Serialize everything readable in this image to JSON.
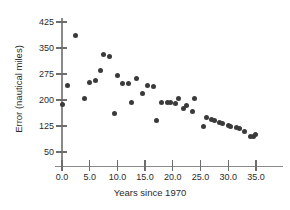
{
  "chart_data": {
    "type": "scatter",
    "title": "",
    "xlabel": "Years since 1970",
    "ylabel": "Error (nautical miles)",
    "xlim": [
      -2.5,
      40.0
    ],
    "ylim": [
      35,
      440
    ],
    "xticks": [
      0.0,
      5.0,
      10.0,
      15.0,
      20.0,
      25.0,
      30.0,
      35.0
    ],
    "xtick_labels": [
      "0.0",
      "5.0",
      "10.0",
      "15.0",
      "20.0",
      "25.0",
      "30.0",
      "35.0"
    ],
    "yticks": [
      50,
      125,
      200,
      275,
      350,
      425
    ],
    "ytick_labels": [
      "50",
      "125",
      "200",
      "275",
      "350",
      "425"
    ],
    "grid": false,
    "legend": null,
    "marker_color": "#3a3a3a",
    "axis_color": "#8a8a8a",
    "x": [
      0.0,
      1.0,
      2.5,
      4.0,
      5.0,
      6.0,
      7.0,
      7.5,
      8.5,
      9.5,
      10.0,
      11.0,
      12.0,
      12.5,
      13.5,
      14.5,
      15.5,
      16.5,
      17.0,
      18.0,
      19.0,
      19.5,
      20.5,
      21.0,
      22.0,
      22.5,
      23.5,
      24.0,
      25.5,
      26.0,
      27.0,
      27.5,
      28.5,
      29.0,
      30.0,
      30.5,
      31.5,
      32.0,
      33.0,
      34.0,
      34.5,
      35.0
    ],
    "y": [
      188,
      242,
      387,
      205,
      250,
      257,
      284,
      330,
      325,
      160,
      272,
      249,
      248,
      192,
      262,
      219,
      243,
      238,
      142,
      194,
      194,
      192,
      191,
      205,
      176,
      184,
      167,
      205,
      124,
      150,
      145,
      141,
      135,
      133,
      126,
      124,
      120,
      118,
      108,
      95,
      94,
      100
    ],
    "points": [
      {
        "x": 0.0,
        "y": 188
      },
      {
        "x": 1.0,
        "y": 242
      },
      {
        "x": 2.5,
        "y": 387
      },
      {
        "x": 4.0,
        "y": 205
      },
      {
        "x": 5.0,
        "y": 250
      },
      {
        "x": 6.0,
        "y": 257
      },
      {
        "x": 7.0,
        "y": 284
      },
      {
        "x": 7.5,
        "y": 330
      },
      {
        "x": 8.5,
        "y": 325
      },
      {
        "x": 9.5,
        "y": 160
      },
      {
        "x": 10.0,
        "y": 272
      },
      {
        "x": 11.0,
        "y": 249
      },
      {
        "x": 12.0,
        "y": 248
      },
      {
        "x": 12.5,
        "y": 192
      },
      {
        "x": 13.5,
        "y": 262
      },
      {
        "x": 14.5,
        "y": 219
      },
      {
        "x": 15.5,
        "y": 243
      },
      {
        "x": 16.5,
        "y": 238
      },
      {
        "x": 17.0,
        "y": 142
      },
      {
        "x": 18.0,
        "y": 194
      },
      {
        "x": 19.0,
        "y": 194
      },
      {
        "x": 19.5,
        "y": 192
      },
      {
        "x": 20.5,
        "y": 191
      },
      {
        "x": 21.0,
        "y": 205
      },
      {
        "x": 22.0,
        "y": 176
      },
      {
        "x": 22.5,
        "y": 184
      },
      {
        "x": 23.5,
        "y": 167
      },
      {
        "x": 24.0,
        "y": 205
      },
      {
        "x": 25.5,
        "y": 124
      },
      {
        "x": 26.0,
        "y": 150
      },
      {
        "x": 27.0,
        "y": 145
      },
      {
        "x": 27.5,
        "y": 141
      },
      {
        "x": 28.5,
        "y": 135
      },
      {
        "x": 29.0,
        "y": 133
      },
      {
        "x": 30.0,
        "y": 126
      },
      {
        "x": 30.5,
        "y": 124
      },
      {
        "x": 31.5,
        "y": 120
      },
      {
        "x": 32.0,
        "y": 118
      },
      {
        "x": 33.0,
        "y": 108
      },
      {
        "x": 34.0,
        "y": 95
      },
      {
        "x": 34.5,
        "y": 94
      },
      {
        "x": 35.0,
        "y": 100
      }
    ]
  }
}
